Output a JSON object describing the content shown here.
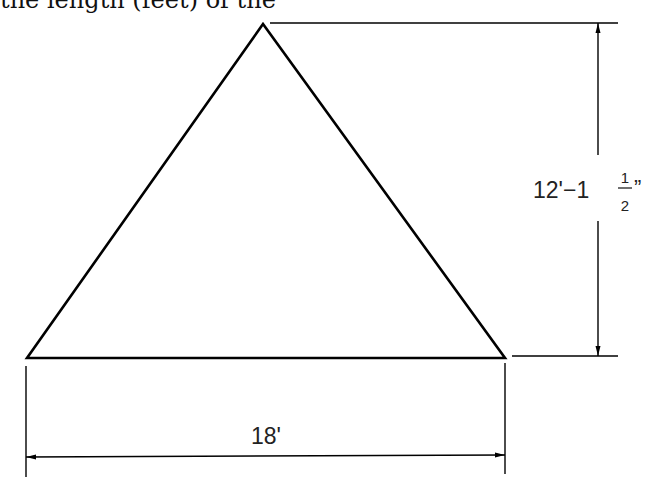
{
  "header": {
    "cropped_text": "the length (feet) of the"
  },
  "diagram": {
    "shape": "triangle",
    "stroke_color": "#000000",
    "height_dimension": {
      "whole": "12'−1",
      "frac_num": "1",
      "frac_den": "2",
      "inch_mark": "”"
    },
    "base_dimension": {
      "label": "18'"
    }
  }
}
